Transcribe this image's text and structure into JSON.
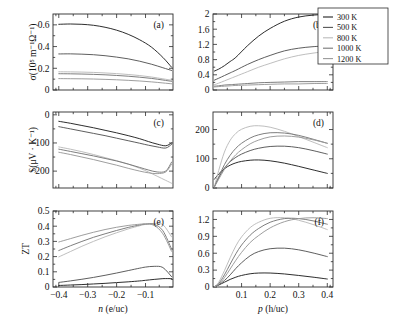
{
  "figure": {
    "title": "",
    "background": "#ffffff",
    "panel_tags": [
      "(a)",
      "(b)",
      "(c)",
      "(d)",
      "(e)",
      "(f)"
    ]
  },
  "legend": {
    "position": "top-right",
    "entries": [
      {
        "label": "300 K",
        "color": "#222222"
      },
      {
        "label": "500 K",
        "color": "#555555"
      },
      {
        "label": "800 K",
        "color": "#bbbbbb"
      },
      {
        "label": "1000 K",
        "color": "#777777"
      },
      {
        "label": "1200 K",
        "color": "#999999"
      }
    ]
  },
  "colors": {
    "axis": "#2b2b2b",
    "t300": "#222222",
    "t500": "#555555",
    "t800": "#bbbbbb",
    "t1000": "#777777",
    "t1200": "#999999"
  },
  "chart_data": [
    {
      "id": "panel-a",
      "type": "line",
      "tag": "(a)",
      "title": "",
      "xlabel": "n (e/uc)",
      "ylabel": "σ(10⁵ m⁻¹Ω⁻¹)",
      "xlim": [
        -0.42,
        -0.005
      ],
      "ylim": [
        0,
        0.7
      ],
      "xticks": [
        -0.4,
        -0.3,
        -0.2,
        -0.1
      ],
      "xticklabels": [
        "",
        "",
        "",
        ""
      ],
      "yticks": [
        0,
        0.2,
        0.4,
        0.6
      ],
      "yticklabels": [
        "0",
        "0.2",
        "0.4",
        "0.6"
      ],
      "grid": false,
      "x": [
        -0.4,
        -0.36,
        -0.32,
        -0.28,
        -0.24,
        -0.2,
        -0.16,
        -0.12,
        -0.08,
        -0.04,
        -0.01
      ],
      "series": [
        {
          "name": "300 K",
          "color": "#222222",
          "values": [
            0.605,
            0.608,
            0.605,
            0.596,
            0.578,
            0.551,
            0.513,
            0.462,
            0.396,
            0.3,
            0.21
          ]
        },
        {
          "name": "500 K",
          "color": "#555555",
          "values": [
            0.332,
            0.333,
            0.33,
            0.325,
            0.316,
            0.303,
            0.287,
            0.265,
            0.238,
            0.205,
            0.18
          ]
        },
        {
          "name": "800 K",
          "color": "#bbbbbb",
          "values": [
            0.168,
            0.167,
            0.165,
            0.162,
            0.157,
            0.151,
            0.143,
            0.133,
            0.12,
            0.103,
            0.09
          ]
        },
        {
          "name": "1000 K",
          "color": "#777777",
          "values": [
            0.15,
            0.149,
            0.147,
            0.144,
            0.14,
            0.134,
            0.127,
            0.118,
            0.107,
            0.092,
            0.08
          ]
        },
        {
          "name": "1200 K",
          "color": "#999999",
          "values": [
            0.105,
            0.104,
            0.103,
            0.101,
            0.098,
            0.094,
            0.089,
            0.083,
            0.075,
            0.065,
            0.057
          ]
        }
      ]
    },
    {
      "id": "panel-b",
      "type": "line",
      "tag": "(b)",
      "title": "",
      "xlabel": "p (h/uc)",
      "ylabel": "",
      "xlim": [
        0.0,
        0.42
      ],
      "ylim": [
        0,
        2.0
      ],
      "xticks": [
        0.1,
        0.2,
        0.3,
        0.4
      ],
      "xticklabels": [
        "",
        "",
        "",
        ""
      ],
      "yticks": [
        0,
        0.4,
        0.8,
        1.2,
        1.6,
        2.0
      ],
      "yticklabels": [
        "0",
        "0.4",
        "0.8",
        "1.2",
        "1.6",
        "2"
      ],
      "grid": false,
      "x": [
        0.005,
        0.02,
        0.04,
        0.06,
        0.08,
        0.12,
        0.16,
        0.2,
        0.25,
        0.3,
        0.35,
        0.4
      ],
      "series": [
        {
          "name": "300 K",
          "color": "#222222",
          "values": [
            0.5,
            0.55,
            0.64,
            0.75,
            0.86,
            1.16,
            1.42,
            1.62,
            1.81,
            1.92,
            1.97,
            1.99
          ]
        },
        {
          "name": "500 K",
          "color": "#555555",
          "values": [
            0.26,
            0.31,
            0.38,
            0.45,
            0.52,
            0.67,
            0.8,
            0.91,
            1.03,
            1.1,
            1.14,
            1.16
          ]
        },
        {
          "name": "800 K",
          "color": "#bbbbbb",
          "values": [
            0.14,
            0.18,
            0.24,
            0.3,
            0.36,
            0.48,
            0.6,
            0.7,
            0.82,
            0.91,
            0.97,
            1.02
          ]
        },
        {
          "name": "1000 K",
          "color": "#777777",
          "values": [
            0.1,
            0.11,
            0.13,
            0.14,
            0.15,
            0.17,
            0.19,
            0.2,
            0.21,
            0.22,
            0.22,
            0.22
          ]
        },
        {
          "name": "1200 K",
          "color": "#999999",
          "values": [
            0.08,
            0.09,
            0.1,
            0.11,
            0.12,
            0.13,
            0.14,
            0.15,
            0.16,
            0.16,
            0.17,
            0.17
          ]
        }
      ]
    },
    {
      "id": "panel-c",
      "type": "line",
      "tag": "(c)",
      "title": "",
      "xlabel": "n (e/uc)",
      "ylabel": "S(μV · K⁻¹)",
      "xlim": [
        -0.42,
        -0.005
      ],
      "ylim": [
        -260,
        10
      ],
      "xticks": [
        -0.4,
        -0.3,
        -0.2,
        -0.1
      ],
      "xticklabels": [
        "",
        "",
        "",
        ""
      ],
      "yticks": [
        0,
        -100,
        -200
      ],
      "yticklabels": [
        "0",
        "−100",
        "−200"
      ],
      "grid": false,
      "x": [
        -0.4,
        -0.36,
        -0.32,
        -0.28,
        -0.24,
        -0.2,
        -0.16,
        -0.12,
        -0.09,
        -0.06,
        -0.03,
        -0.01
      ],
      "series": [
        {
          "name": "300 K",
          "color": "#222222",
          "values": [
            -23,
            -30,
            -38,
            -46,
            -55,
            -64,
            -74,
            -85,
            -95,
            -104,
            -110,
            -100
          ]
        },
        {
          "name": "500 K",
          "color": "#555555",
          "values": [
            -42,
            -50,
            -58,
            -66,
            -74,
            -83,
            -92,
            -101,
            -108,
            -114,
            -118,
            -105
          ]
        },
        {
          "name": "800 K",
          "color": "#bbbbbb",
          "values": [
            -114,
            -122,
            -131,
            -141,
            -152,
            -163,
            -175,
            -190,
            -203,
            -218,
            -233,
            -243
          ]
        },
        {
          "name": "1000 K",
          "color": "#777777",
          "values": [
            -122,
            -130,
            -138,
            -146,
            -155,
            -164,
            -175,
            -187,
            -196,
            -203,
            -200,
            -168
          ]
        },
        {
          "name": "1200 K",
          "color": "#999999",
          "values": [
            -133,
            -141,
            -150,
            -159,
            -169,
            -179,
            -190,
            -200,
            -206,
            -209,
            -203,
            -175
          ]
        }
      ]
    },
    {
      "id": "panel-d",
      "type": "line",
      "tag": "(d)",
      "title": "",
      "xlabel": "p (h/uc)",
      "ylabel": "",
      "xlim": [
        0.0,
        0.42
      ],
      "ylim": [
        0,
        260
      ],
      "xticks": [
        0.1,
        0.2,
        0.3,
        0.4
      ],
      "xticklabels": [
        "",
        "",
        "",
        ""
      ],
      "yticks": [
        0,
        100,
        200
      ],
      "yticklabels": [
        "0",
        "100",
        "200"
      ],
      "grid": false,
      "x": [
        0.005,
        0.02,
        0.04,
        0.06,
        0.08,
        0.1,
        0.13,
        0.16,
        0.2,
        0.25,
        0.3,
        0.35,
        0.4
      ],
      "series": [
        {
          "name": "300 K",
          "color": "#222222",
          "values": [
            30,
            48,
            66,
            78,
            86,
            91,
            95,
            96,
            93,
            85,
            74,
            62,
            50
          ]
        },
        {
          "name": "500 K",
          "color": "#555555",
          "values": [
            4,
            35,
            68,
            90,
            105,
            116,
            128,
            136,
            142,
            143,
            138,
            128,
            116
          ]
        },
        {
          "name": "800 K",
          "color": "#bbbbbb",
          "values": [
            4,
            60,
            123,
            163,
            187,
            201,
            211,
            213,
            208,
            194,
            176,
            157,
            138
          ]
        },
        {
          "name": "1000 K",
          "color": "#777777",
          "values": [
            4,
            38,
            80,
            112,
            136,
            153,
            171,
            182,
            189,
            188,
            180,
            167,
            153
          ]
        },
        {
          "name": "1200 K",
          "color": "#999999",
          "values": [
            4,
            30,
            64,
            92,
            114,
            131,
            151,
            164,
            175,
            178,
            174,
            165,
            153
          ]
        }
      ]
    },
    {
      "id": "panel-e",
      "type": "line",
      "tag": "(e)",
      "title": "",
      "xlabel": "n (e/uc)",
      "ylabel": "ZT",
      "xlim": [
        -0.42,
        -0.005
      ],
      "ylim": [
        0,
        0.5
      ],
      "xticks": [
        -0.4,
        -0.3,
        -0.2,
        -0.1
      ],
      "xticklabels": [
        "−0.4",
        "−0.3",
        "−0.2",
        "−0.1"
      ],
      "yticks": [
        0,
        0.1,
        0.2,
        0.3,
        0.4,
        0.5
      ],
      "yticklabels": [
        "0",
        "0.1",
        "0.2",
        "0.3",
        "0.4",
        "0.5"
      ],
      "grid": false,
      "x": [
        -0.4,
        -0.36,
        -0.32,
        -0.28,
        -0.24,
        -0.2,
        -0.16,
        -0.12,
        -0.1,
        -0.07,
        -0.04,
        -0.01
      ],
      "series": [
        {
          "name": "300 K",
          "color": "#222222",
          "values": [
            0.01,
            0.013,
            0.016,
            0.02,
            0.024,
            0.029,
            0.034,
            0.04,
            0.044,
            0.05,
            0.055,
            0.055
          ]
        },
        {
          "name": "500 K",
          "color": "#555555",
          "values": [
            0.03,
            0.04,
            0.051,
            0.063,
            0.077,
            0.092,
            0.108,
            0.124,
            0.131,
            0.136,
            0.128,
            0.068
          ]
        },
        {
          "name": "800 K",
          "color": "#bbbbbb",
          "values": [
            0.198,
            0.233,
            0.268,
            0.3,
            0.33,
            0.357,
            0.382,
            0.403,
            0.412,
            0.418,
            0.41,
            0.33
          ]
        },
        {
          "name": "1000 K",
          "color": "#777777",
          "values": [
            0.24,
            0.271,
            0.3,
            0.327,
            0.35,
            0.372,
            0.392,
            0.408,
            0.414,
            0.412,
            0.37,
            0.25
          ]
        },
        {
          "name": "1200 K",
          "color": "#999999",
          "values": [
            0.296,
            0.318,
            0.34,
            0.36,
            0.378,
            0.393,
            0.405,
            0.413,
            0.415,
            0.405,
            0.35,
            0.235
          ]
        }
      ]
    },
    {
      "id": "panel-f",
      "type": "line",
      "tag": "(f)",
      "title": "",
      "xlabel": "p (h/uc)",
      "ylabel": "",
      "xlim": [
        0.0,
        0.42
      ],
      "ylim": [
        0,
        1.35
      ],
      "xticks": [
        0.1,
        0.2,
        0.3,
        0.4
      ],
      "xticklabels": [
        "0.1",
        "0.2",
        "0.3",
        "0.4"
      ],
      "yticks": [
        0,
        0.3,
        0.6,
        0.9,
        1.2
      ],
      "yticklabels": [
        "0",
        "0.3",
        "0.6",
        "0.9",
        "1.2"
      ],
      "grid": false,
      "x": [
        0.005,
        0.02,
        0.04,
        0.06,
        0.08,
        0.1,
        0.13,
        0.16,
        0.2,
        0.25,
        0.3,
        0.35,
        0.4
      ],
      "series": [
        {
          "name": "300 K",
          "color": "#222222",
          "values": [
            0.005,
            0.035,
            0.085,
            0.135,
            0.175,
            0.205,
            0.235,
            0.248,
            0.248,
            0.232,
            0.205,
            0.175,
            0.142
          ]
        },
        {
          "name": "500 K",
          "color": "#555555",
          "values": [
            0.005,
            0.04,
            0.115,
            0.215,
            0.33,
            0.43,
            0.555,
            0.63,
            0.68,
            0.69,
            0.66,
            0.605,
            0.54
          ]
        },
        {
          "name": "800 K",
          "color": "#bbbbbb",
          "values": [
            0.005,
            0.085,
            0.29,
            0.52,
            0.73,
            0.89,
            1.055,
            1.15,
            1.22,
            1.23,
            1.185,
            1.11,
            1.02
          ]
        },
        {
          "name": "1000 K",
          "color": "#777777",
          "values": [
            0.005,
            0.06,
            0.215,
            0.405,
            0.59,
            0.745,
            0.92,
            1.04,
            1.15,
            1.215,
            1.215,
            1.175,
            1.115
          ]
        },
        {
          "name": "1200 K",
          "color": "#999999",
          "values": [
            0.005,
            0.045,
            0.165,
            0.32,
            0.475,
            0.615,
            0.79,
            0.915,
            1.05,
            1.16,
            1.215,
            1.23,
            1.215
          ]
        }
      ]
    }
  ]
}
